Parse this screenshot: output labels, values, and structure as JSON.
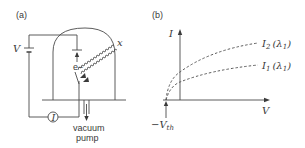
{
  "panel_a": {
    "label": "(a)",
    "voltage_label": "V",
    "ammeter_label": "I",
    "electron_label": "e−",
    "radiation_label": "x",
    "pump_label_line1": "vacuum",
    "pump_label_line2": "pump"
  },
  "panel_b": {
    "label": "(b)",
    "y_axis_label": "I",
    "x_axis_label": "V",
    "threshold_label": "−V",
    "threshold_sub": "th",
    "curve_upper": {
      "name": "I",
      "sub": "2",
      "param": "(λ",
      "param_sub": "1",
      "close": ")"
    },
    "curve_lower": {
      "name": "I",
      "sub": "1",
      "param": "(λ",
      "param_sub": "1",
      "close": ")"
    }
  },
  "colors": {
    "line": "#4a4a4a",
    "text": "#3a3a3a"
  }
}
